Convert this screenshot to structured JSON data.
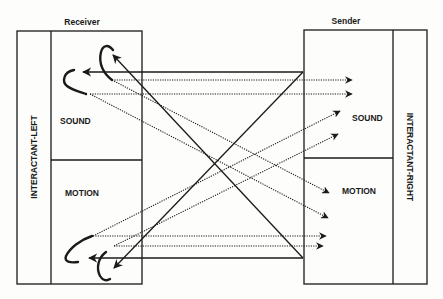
{
  "diagram": {
    "left_header": "Receiver",
    "right_header": "Sender",
    "left_interactant": "INTERACTANT-LEFT",
    "right_interactant": "INTERACTANT-RIGHT",
    "left_channels": {
      "top": "SOUND",
      "bottom": "MOTION"
    },
    "right_channels": {
      "top": "SOUND",
      "bottom": "MOTION"
    },
    "colors": {
      "ink": "#1a1a1a",
      "paper": "#fdfdfb"
    },
    "line_styles": {
      "solid": "feedback to receiver",
      "dotted": "signal to sender"
    }
  }
}
